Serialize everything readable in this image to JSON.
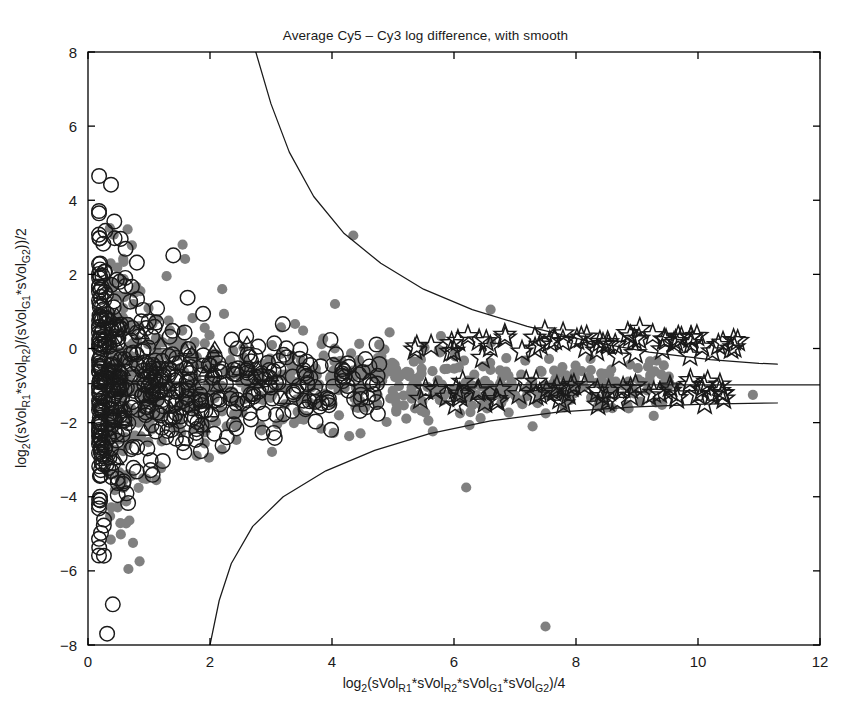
{
  "figure": {
    "title": "Average Cy5 – Cy3 log difference, with smooth",
    "background_color": "#ffffff",
    "frame_color": "#000000"
  },
  "axes": {
    "x": {
      "label_parts": [
        "log",
        "2",
        "(sVol",
        "R1",
        "*sVol",
        "R2",
        "*sVol",
        "G1",
        "*sVol",
        "G2",
        ")/4"
      ],
      "label_text": "log2(sVolR1*sVolR2*sVolG1*sVolG2)/4",
      "ticks": [
        0,
        2,
        4,
        6,
        8,
        10,
        12
      ],
      "tick_labels": [
        "0",
        "2",
        "4",
        "6",
        "8",
        "10",
        "12"
      ],
      "range": [
        0,
        12
      ]
    },
    "y": {
      "label_parts": [
        "log",
        "2",
        "((sVol",
        "R1",
        "*sVol",
        "R2",
        ")/(sVol",
        "G1",
        "*sVol",
        "G2",
        "))/2"
      ],
      "label_text": "log2((sVolR1*sVolR2)/(sVolG1*sVolG2))/2",
      "ticks": [
        -8,
        -6,
        -4,
        -2,
        0,
        2,
        4,
        6,
        8
      ],
      "tick_labels": [
        "−8",
        "−6",
        "−4",
        "−2",
        "0",
        "2",
        "4",
        "6",
        "8"
      ],
      "range": [
        -8,
        8
      ]
    }
  },
  "chart_data": {
    "type": "scatter",
    "title": "Average Cy5 – Cy3 log difference, with smooth",
    "xlabel": "log2(sVolR1*sVolR2*sVolG1*sVolG2)/4",
    "ylabel": "log2((sVolR1*sVolR2)/(sVolG1*sVolG2))/2",
    "xlim": [
      0,
      12
    ],
    "ylim": [
      -8,
      8
    ],
    "grid": false,
    "legend": "none",
    "colors": {
      "gray_dot_fill": "#808080",
      "open_circle_stroke": "#1a1a1a",
      "star_stroke": "#1a1a1a",
      "triangle_stroke": "#1a1a1a",
      "smooth_line": "#1a1a1a"
    },
    "series": [
      {
        "name": "gray filled dots",
        "marker": "filled-circle",
        "color": "#808080",
        "count": 620,
        "description": "Dense gray point cloud forming a fan that widens toward low intensity; centered near y = -1 and spreading from x ~ 0.3 to x ~ 11.",
        "notable_points": [
          {
            "x": 4.35,
            "y": 3.05
          },
          {
            "x": 1.55,
            "y": 2.8
          },
          {
            "x": 6.6,
            "y": 1.05
          },
          {
            "x": 7.5,
            "y": -7.5
          },
          {
            "x": 10.9,
            "y": -1.25
          },
          {
            "x": 2.2,
            "y": 1.6
          },
          {
            "x": 4.05,
            "y": 1.2
          },
          {
            "x": 6.2,
            "y": -3.75
          }
        ]
      },
      {
        "name": "open circles",
        "marker": "open-circle",
        "color": "#1a1a1a",
        "count": 560,
        "description": "Black unfilled circles concentrated in the dense low-intensity wedge from x ~ 0.2 to x ~ 4.5, spanning y ~ -4.5 to y ~ 1.5."
      },
      {
        "name": "triangles",
        "marker": "open-triangle",
        "color": "#1a1a1a",
        "count": 42,
        "description": "Small black open triangles interleaved within the dense wedge, x ~ 0.5 to 3.2."
      },
      {
        "name": "stars",
        "marker": "open-star",
        "color": "#1a1a1a",
        "count": 120,
        "description": "Five-pointed open stars in two tight horizontal bands at y ~ 0.15 and y ~ -1.15, extending from x ~ 5.3 to x ~ 10.7, high intensity region."
      }
    ],
    "smooth_curves": [
      {
        "name": "upper confidence band",
        "description": "Hyperbolic smooth upper bound; enters plot at top (y=8) near x=2.75, descends steeply and asymptotes toward y ~ -0.4 at the right edge.",
        "points": [
          [
            2.75,
            8
          ],
          [
            3.0,
            6.6
          ],
          [
            3.3,
            5.3
          ],
          [
            3.7,
            4.1
          ],
          [
            4.2,
            3.1
          ],
          [
            4.8,
            2.3
          ],
          [
            5.5,
            1.6
          ],
          [
            6.3,
            1.05
          ],
          [
            7.2,
            0.6
          ],
          [
            8.2,
            0.2
          ],
          [
            9.2,
            -0.1
          ],
          [
            10.2,
            -0.3
          ],
          [
            11.0,
            -0.4
          ],
          [
            11.3,
            -0.42
          ]
        ]
      },
      {
        "name": "center smooth",
        "description": "Nearly flat central smooth at y ~ -0.95 extending the full width to the right frame edge.",
        "points": [
          [
            0.0,
            -0.95
          ],
          [
            4.0,
            -0.97
          ],
          [
            8.0,
            -0.98
          ],
          [
            12.0,
            -0.98
          ]
        ]
      },
      {
        "name": "lower confidence band",
        "description": "Mirror hyperbolic smooth lower bound; exits plot at bottom (y=-8) near x=2.0, rises and asymptotes toward y ~ -1.5 at the right edge.",
        "points": [
          [
            2.0,
            -8
          ],
          [
            2.15,
            -6.8
          ],
          [
            2.35,
            -5.8
          ],
          [
            2.7,
            -4.8
          ],
          [
            3.2,
            -4.0
          ],
          [
            3.9,
            -3.3
          ],
          [
            4.7,
            -2.75
          ],
          [
            5.6,
            -2.3
          ],
          [
            6.6,
            -1.95
          ],
          [
            7.7,
            -1.72
          ],
          [
            8.9,
            -1.58
          ],
          [
            10.1,
            -1.5
          ],
          [
            11.3,
            -1.47
          ]
        ]
      }
    ]
  }
}
